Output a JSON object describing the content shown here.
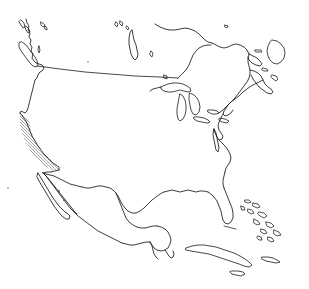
{
  "figure": {
    "kind": "outline-map",
    "title": "North America outline map",
    "width": 309,
    "height": 289,
    "background_color": "#ffffff",
    "line_color": "#1a1a1a",
    "hatch_color": "#9a9a9a",
    "style": "black line-art coastline outline on white, no labels, no graticule"
  },
  "map_data": {
    "type": "outline-map",
    "projection_hint": "conic / lambert-like, North America centered",
    "extent_description": "Pacific Northwest and Hudson Bay at top, Panama-less Central America and Caribbean at bottom",
    "labels_visible": false,
    "graticule_visible": false,
    "features": [
      {
        "name": "united-states-mainland",
        "kind": "country-outline",
        "visible": true
      },
      {
        "name": "canada-southern-portion",
        "kind": "country-outline",
        "visible": true
      },
      {
        "name": "mexico",
        "kind": "country-outline",
        "visible": true
      },
      {
        "name": "usa-canada-border-49th-parallel",
        "kind": "political-border",
        "visible": true,
        "description": "straight horizontal line across the west"
      },
      {
        "name": "baja-california-peninsula",
        "kind": "peninsula",
        "visible": true
      },
      {
        "name": "florida-peninsula",
        "kind": "peninsula",
        "visible": true
      },
      {
        "name": "yucatan-peninsula",
        "kind": "peninsula",
        "visible": true
      },
      {
        "name": "great-lakes",
        "kind": "lake-group",
        "visible": true,
        "members": [
          "lake-superior",
          "lake-michigan",
          "lake-huron",
          "lake-erie",
          "lake-ontario"
        ]
      },
      {
        "name": "hudson-bay-james-bay",
        "kind": "bay",
        "visible": true
      },
      {
        "name": "gulf-of-mexico",
        "kind": "gulf",
        "visible": true
      },
      {
        "name": "gulf-of-california",
        "kind": "gulf",
        "visible": true
      },
      {
        "name": "chesapeake-bay",
        "kind": "bay",
        "visible": true
      },
      {
        "name": "gulf-of-st-lawrence",
        "kind": "gulf",
        "visible": true
      },
      {
        "name": "vancouver-island",
        "kind": "island",
        "visible": true
      },
      {
        "name": "haida-gwaii",
        "kind": "island",
        "visible": true
      },
      {
        "name": "newfoundland",
        "kind": "island",
        "visible": true
      },
      {
        "name": "nova-scotia",
        "kind": "peninsula",
        "visible": true
      },
      {
        "name": "cuba",
        "kind": "island",
        "visible": true
      },
      {
        "name": "bahamas",
        "kind": "island-group",
        "visible": true
      },
      {
        "name": "jamaica",
        "kind": "island",
        "visible": true
      },
      {
        "name": "long-island",
        "kind": "island",
        "visible": true
      },
      {
        "name": "arctic-islands-fragments",
        "kind": "island-group",
        "visible": true
      }
    ],
    "highlight": {
      "name": "california-hatched-region",
      "style": "diagonal-hatch",
      "hatch_color": "#9a9a9a",
      "hatch_angle_degrees": 45,
      "hatch_spacing_px": 3,
      "location": "west coast of the United States, California",
      "visible": true
    }
  }
}
